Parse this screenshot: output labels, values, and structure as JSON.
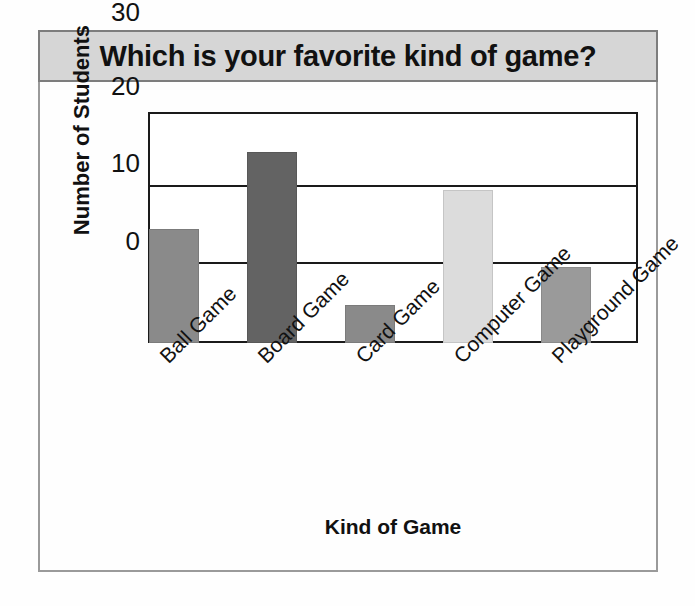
{
  "chart_data": {
    "type": "bar",
    "title": "Which is your favorite kind of game?",
    "xlabel": "Kind of Game",
    "ylabel": "Number of Students",
    "categories": [
      "Ball Game",
      "Board Game",
      "Card Game",
      "Computer Game",
      "Playground Game"
    ],
    "values": [
      15,
      25,
      5,
      20,
      10
    ],
    "ylim": [
      0,
      30
    ],
    "yticks": [
      0,
      10,
      20,
      30
    ],
    "ytick_labels": [
      "0",
      "10",
      "20",
      "30"
    ],
    "grid": true,
    "legend": false,
    "bar_colors": [
      "#8a8a8a",
      "#636363",
      "#8a8a8a",
      "#dcdcdc",
      "#9a9a9a"
    ]
  },
  "style": {
    "banner_background": "#d6d6d6",
    "banner_border": "#7d7d7d",
    "frame_border": "#9a9a9a",
    "axis_color": "#1a1a1a",
    "page_background": "#fefefe"
  }
}
